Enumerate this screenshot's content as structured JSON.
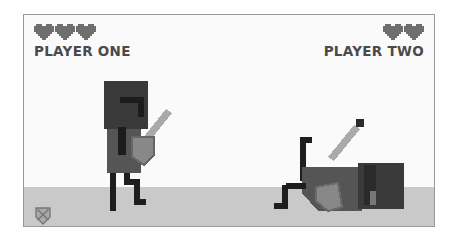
{
  "game": {
    "players": [
      {
        "name": "PLAYER ONE",
        "hearts": 3,
        "side": "left",
        "state": "standing"
      },
      {
        "name": "PLAYER TWO",
        "hearts": 2,
        "side": "right",
        "state": "knocked-down"
      }
    ],
    "icons": {
      "heart": "heart-icon",
      "emblem": "shield-emblem-icon"
    },
    "colors": {
      "heart": "#6e6e6e",
      "text": "#4a4a4a",
      "ground": "#c9c9c9",
      "sky": "#fafafa",
      "helmet": "#3a3a3a",
      "body": "#555555",
      "shield": "#888888",
      "sword": "#aaaaaa",
      "legs": "#1e1e1e"
    }
  }
}
